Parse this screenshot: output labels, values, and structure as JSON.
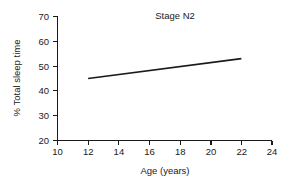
{
  "chart_data": {
    "type": "line",
    "title": "Stage N2",
    "xlabel": "Age (years)",
    "ylabel": "% Total sleep time",
    "xlim": [
      10,
      24
    ],
    "ylim": [
      20,
      70
    ],
    "xticks": [
      10,
      12,
      14,
      16,
      18,
      20,
      22,
      24
    ],
    "yticks": [
      20,
      30,
      40,
      50,
      60,
      70
    ],
    "xtick_labels": [
      "10",
      "12",
      "14",
      "16",
      "18",
      "20",
      "22",
      "24"
    ],
    "ytick_labels": [
      "20",
      "30",
      "40",
      "50",
      "60",
      "70"
    ],
    "grid": false,
    "legend": false,
    "series": [
      {
        "name": "Stage N2 regression",
        "x": [
          12,
          22
        ],
        "values": [
          45,
          53
        ],
        "color": "#1a1a1a"
      }
    ]
  }
}
